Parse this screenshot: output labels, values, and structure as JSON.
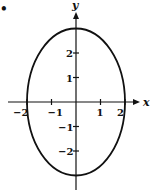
{
  "chart_data": {
    "type": "line",
    "title": "",
    "equation": "x^2/4 + y^2/9 = 1",
    "series": [
      {
        "name": "ellipse",
        "center": [
          0,
          0
        ],
        "semi_axis_x": 2,
        "semi_axis_y": 3
      }
    ],
    "key_points": [
      [
        2,
        0
      ],
      [
        -2,
        0
      ],
      [
        0,
        3
      ],
      [
        0,
        -3
      ]
    ],
    "xlabel": "x",
    "ylabel": "y",
    "x_ticks": [
      -2,
      -1,
      1,
      2
    ],
    "y_ticks": [
      -2,
      -1,
      1,
      2
    ],
    "x_tick_labels": [
      "−2",
      "−1",
      "1",
      "2"
    ],
    "y_tick_labels": [
      "−2",
      "−1",
      "1",
      "2"
    ],
    "xlim": [
      -2.3,
      2.5
    ],
    "ylim": [
      -3.4,
      3.9
    ],
    "grid": false,
    "legend": null
  },
  "marker": "•",
  "colors": {
    "ink": "#111111",
    "background": "#ffffff"
  }
}
